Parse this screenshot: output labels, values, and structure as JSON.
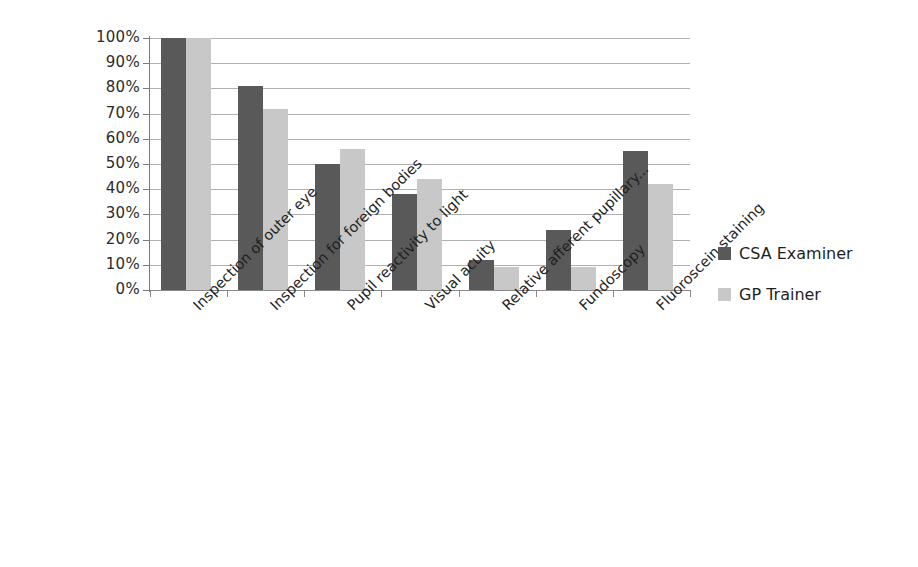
{
  "chart_data": {
    "type": "bar",
    "title": "",
    "subtitle": "",
    "xlabel": "",
    "ylabel": "",
    "ylim": [
      0,
      100
    ],
    "ytick_labels": [
      "100%",
      "90%",
      "80%",
      "70%",
      "60%",
      "50%",
      "40%",
      "30%",
      "20%",
      "10%",
      "0%"
    ],
    "ytick_values": [
      100,
      90,
      80,
      70,
      60,
      50,
      40,
      30,
      20,
      10,
      0
    ],
    "grid": true,
    "legend_position": "right",
    "value_suffix": "%",
    "categories": [
      "Inspection of outer eye",
      "Inspection for foreign bodies",
      "Pupil reactivity to light",
      "Visual acuity",
      "Relative afferent pupillary...",
      "Fundoscopy",
      "Fluoroscein staining"
    ],
    "series": [
      {
        "name": "CSA Examiner",
        "color": "#595959",
        "values": [
          100,
          81,
          50,
          38,
          12,
          24,
          55
        ]
      },
      {
        "name": "GP Trainer",
        "color": "#c8c8c8",
        "values": [
          100,
          72,
          56,
          44,
          9,
          9,
          42
        ]
      }
    ]
  },
  "legend": {
    "items": [
      {
        "label": "CSA Examiner",
        "swatch": "#595959"
      },
      {
        "label": "GP Trainer",
        "swatch": "#c8c8c8"
      }
    ]
  }
}
